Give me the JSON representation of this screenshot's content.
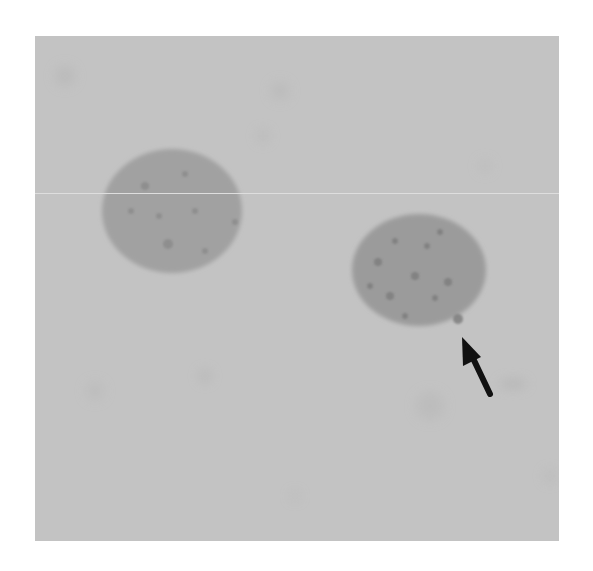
{
  "figure": {
    "type": "micrograph",
    "background_color": "#c3c3c3",
    "cells": [
      {
        "id": "left-cell",
        "cx": 137,
        "cy": 175,
        "rx": 70,
        "ry": 62,
        "fill": "#9d9d9d"
      },
      {
        "id": "right-cell",
        "cx": 384,
        "cy": 234,
        "rx": 67,
        "ry": 56,
        "fill": "#979797"
      }
    ],
    "annotation": {
      "type": "arrow",
      "color": "#111111",
      "tip": [
        427,
        301
      ],
      "tail": [
        455,
        358
      ]
    }
  }
}
